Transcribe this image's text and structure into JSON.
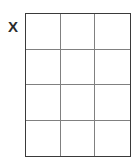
{
  "figure": {
    "type": "empty-grid-table",
    "background_color": "#ffffff",
    "label": {
      "text": "X",
      "color": "#2b2b2b",
      "position": "left-of-grid"
    },
    "grid": {
      "columns": 3,
      "rows": 4,
      "outer_border_color": "#3a3a3a",
      "inner_line_color": "#808080",
      "cell_fill_color": "#ffffff",
      "cells": [
        [
          "",
          "",
          ""
        ],
        [
          "",
          "",
          ""
        ],
        [
          "",
          "",
          ""
        ],
        [
          "",
          "",
          ""
        ]
      ]
    }
  }
}
